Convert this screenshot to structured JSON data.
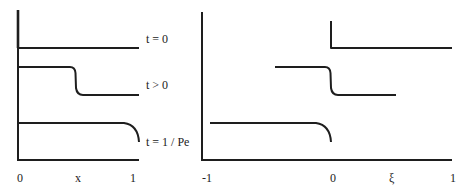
{
  "left_panel": {
    "curve_labels": [
      "t = 0",
      "t > 0",
      "t = 1 / Pe"
    ],
    "x_ticks": [
      "0",
      "x",
      "1"
    ]
  },
  "right_panel": {
    "x_ticks": [
      "-1",
      "0",
      "ξ",
      "1"
    ]
  },
  "colors": {
    "line": "#1e1e1e",
    "background": "#ffffff"
  }
}
